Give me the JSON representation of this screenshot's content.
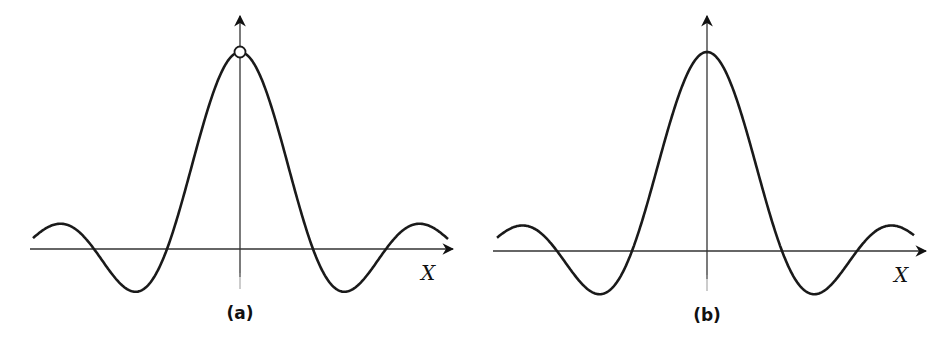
{
  "figure": {
    "panels": [
      {
        "id": "a",
        "caption": "(a)",
        "x_axis_label": "X",
        "origin": {
          "x": 240,
          "y": 249
        },
        "x_axis": {
          "x1": 30,
          "x2": 453
        },
        "y_axis": {
          "y_top": 16
        },
        "peak_y": 52,
        "x_range_px": [
          33,
          448
        ],
        "has_open_circle_at_peak": true
      },
      {
        "id": "b",
        "caption": "(b)",
        "x_axis_label": "X",
        "origin": {
          "x": 707,
          "y": 251
        },
        "x_axis": {
          "x1": 493,
          "x2": 926
        },
        "y_axis": {
          "y_top": 16
        },
        "peak_y": 52,
        "x_range_px": [
          497,
          914
        ],
        "has_open_circle_at_peak": false
      }
    ]
  },
  "chart_data": [
    {
      "type": "line",
      "title": "(a)",
      "function": "sin(x)/x with removable discontinuity at x=0 (open circle)",
      "xlabel": "X",
      "ylabel": "",
      "grid": false,
      "x_zeros_px": [
        95,
        167,
        313,
        385
      ],
      "local_max_px": [
        [
          63,
          223
        ],
        [
          240,
          52
        ],
        [
          417,
          223
        ]
      ],
      "local_min_px": [
        [
          137,
          292
        ],
        [
          343,
          292
        ]
      ]
    },
    {
      "type": "line",
      "title": "(b)",
      "function": "sin(x)/x with value defined at x=0 (continuous)",
      "xlabel": "X",
      "ylabel": "",
      "grid": false,
      "x_zeros_px": [
        558,
        632,
        782,
        856
      ],
      "local_max_px": [
        [
          527,
          225
        ],
        [
          707,
          52
        ],
        [
          887,
          225
        ]
      ],
      "local_min_px": [
        [
          601,
          294
        ],
        [
          812,
          294
        ]
      ]
    }
  ]
}
